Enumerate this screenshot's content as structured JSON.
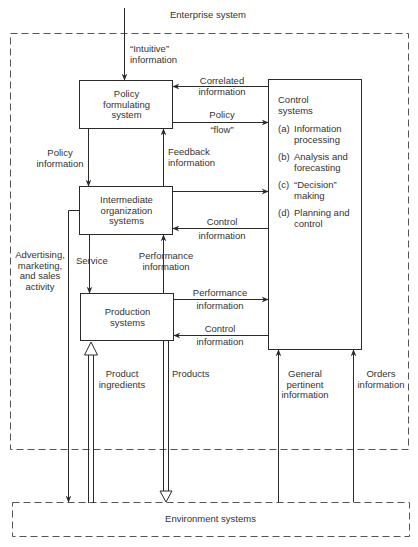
{
  "diagram": {
    "enterprise_label": "Enterprise system",
    "environment_label": "Environment systems",
    "boxes": {
      "policy": "Policy\nformulating\nsystem",
      "intermediate": "Intermediate\norganization\nsystems",
      "production": "Production\nsystems",
      "control": {
        "title": "Control\nsystems",
        "items": [
          {
            "key": "(a)",
            "text": "Information\nprocessing"
          },
          {
            "key": "(b)",
            "text": "Analysis and\nforecasting"
          },
          {
            "key": "(c)",
            "text": "“Decision”\nmaking"
          },
          {
            "key": "(d)",
            "text": "Planning and\ncontrol"
          }
        ]
      }
    },
    "edge_labels": {
      "intuitive": "“Intuitive”\ninformation",
      "correlated": "Correlated\ninformation",
      "policy_flow_top": "Policy",
      "policy_flow_bottom": "“flow”",
      "policy_information": "Policy\ninformation",
      "feedback": "Feedback\ninformation",
      "control_info_1_top": "Control",
      "control_info_1_bottom": "information",
      "advertising": "Advertising,\nmarketing,\nand sales\nactivity",
      "service": "Service",
      "performance_1": "Performance\ninformation",
      "performance_2_top": "Performance",
      "performance_2_bottom": "information",
      "control_info_2_top": "Control",
      "control_info_2_bottom": "information",
      "product_ingredients": "Product\ningredients",
      "products": "Products",
      "general_pertinent": "General\npertinent\ninformation",
      "orders": "Orders\ninformation"
    },
    "colors": {
      "line": "#2a2a2a",
      "dashed": "#555555",
      "background": "#ffffff"
    }
  }
}
